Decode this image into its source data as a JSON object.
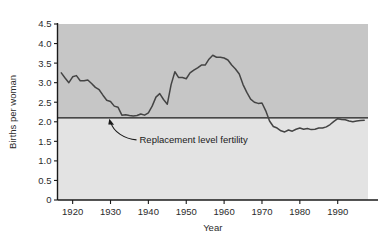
{
  "chart_data": {
    "type": "line",
    "title": "",
    "xlabel": "Year",
    "ylabel": "Births per woman",
    "xlim": [
      1916,
      1998
    ],
    "ylim": [
      0,
      4.5
    ],
    "grid": false,
    "legend_position": "none",
    "xticks": [
      1920,
      1930,
      1940,
      1950,
      1960,
      1970,
      1980,
      1990
    ],
    "xtick_labels": [
      "1920",
      "1930",
      "1940",
      "1950",
      "1960",
      "1970",
      "1980",
      "1990"
    ],
    "yticks": [
      0,
      0.5,
      1.0,
      1.5,
      2.0,
      2.5,
      3.0,
      3.5,
      4.0,
      4.5
    ],
    "ytick_labels": [
      "0",
      "0.5",
      "1.0",
      "1.5",
      "2.0",
      "2.5",
      "3.0",
      "3.5",
      "4.0",
      "4.5"
    ],
    "annotations": [
      {
        "text": "Replacement level fertility",
        "value": 2.1,
        "type": "horizontal-reference-line",
        "arrow_points_to_year": 1930
      }
    ],
    "series": [
      {
        "name": "Total fertility rate",
        "color": "#444444",
        "x": [
          1917,
          1918,
          1919,
          1920,
          1921,
          1922,
          1923,
          1924,
          1925,
          1926,
          1927,
          1928,
          1929,
          1930,
          1931,
          1932,
          1933,
          1934,
          1935,
          1936,
          1937,
          1938,
          1939,
          1940,
          1941,
          1942,
          1943,
          1944,
          1945,
          1946,
          1947,
          1948,
          1949,
          1950,
          1951,
          1952,
          1953,
          1954,
          1955,
          1956,
          1957,
          1958,
          1959,
          1960,
          1961,
          1962,
          1963,
          1964,
          1965,
          1966,
          1967,
          1968,
          1969,
          1970,
          1971,
          1972,
          1973,
          1974,
          1975,
          1976,
          1977,
          1978,
          1979,
          1980,
          1981,
          1982,
          1983,
          1984,
          1985,
          1986,
          1987,
          1988,
          1989,
          1990,
          1991,
          1992,
          1993,
          1994,
          1995,
          1996,
          1997
        ],
        "y": [
          3.25,
          3.12,
          3.0,
          3.15,
          3.18,
          3.05,
          3.05,
          3.07,
          2.98,
          2.88,
          2.82,
          2.68,
          2.55,
          2.52,
          2.4,
          2.37,
          2.17,
          2.18,
          2.16,
          2.15,
          2.16,
          2.2,
          2.17,
          2.23,
          2.4,
          2.63,
          2.72,
          2.57,
          2.45,
          2.95,
          3.28,
          3.13,
          3.13,
          3.1,
          3.25,
          3.32,
          3.38,
          3.45,
          3.45,
          3.6,
          3.7,
          3.65,
          3.65,
          3.63,
          3.58,
          3.45,
          3.35,
          3.22,
          2.95,
          2.75,
          2.58,
          2.5,
          2.47,
          2.48,
          2.28,
          2.02,
          1.88,
          1.84,
          1.77,
          1.74,
          1.79,
          1.76,
          1.81,
          1.84,
          1.81,
          1.83,
          1.8,
          1.81,
          1.84,
          1.84,
          1.87,
          1.93,
          2.01,
          2.08,
          2.06,
          2.05,
          2.02,
          2.0,
          2.02,
          2.03,
          2.04
        ]
      }
    ]
  },
  "figure": {
    "background_color": "#ffffff",
    "band_above_color": "#c6c6c6",
    "band_below_color": "#e3e3e3",
    "axis_color": "#1a1a1a",
    "reference_line_color": "#1a1a1a"
  }
}
